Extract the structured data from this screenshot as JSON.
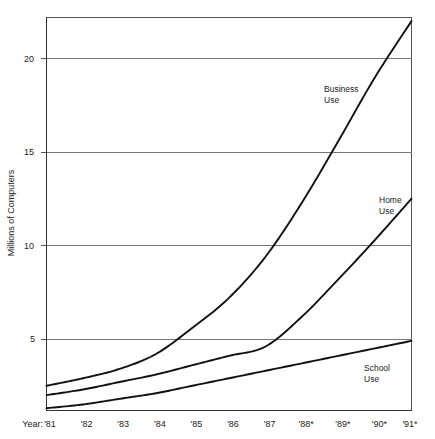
{
  "chart_data": {
    "type": "line",
    "title": "",
    "xlabel": "Year:",
    "ylabel": "Millions of Computers",
    "categories": [
      "'81",
      "'82",
      "'83",
      "'84",
      "'85",
      "'86",
      "'87",
      "'88*",
      "'89*",
      "'90*",
      "'91*"
    ],
    "ylim": [
      0,
      22.5
    ],
    "xlim_labels": [
      "'81",
      "'91*"
    ],
    "y_ticks": [
      5,
      10,
      15,
      20
    ],
    "y_tick_labels": [
      "5",
      "10",
      "15",
      "20"
    ],
    "grid": "horizontal",
    "legend_position": "inline-annotations",
    "series": [
      {
        "name": "Business Use",
        "label_line1": "Business",
        "label_line2": "Use",
        "values": [
          2.5,
          2.9,
          3.4,
          4.2,
          5.6,
          7.2,
          9.4,
          12.3,
          15.6,
          19.0,
          22.0
        ],
        "color": "#111111"
      },
      {
        "name": "Home Use",
        "label_line1": "Home",
        "label_line2": "Use",
        "values": [
          2.0,
          2.3,
          2.7,
          3.1,
          3.6,
          4.1,
          4.6,
          6.2,
          8.2,
          10.3,
          12.5
        ],
        "color": "#111111"
      },
      {
        "name": "School Use",
        "label_line1": "School",
        "label_line2": "Use",
        "values": [
          1.3,
          1.5,
          1.8,
          2.1,
          2.5,
          2.9,
          3.3,
          3.7,
          4.1,
          4.5,
          4.9
        ],
        "color": "#111111"
      }
    ],
    "annotations": [
      {
        "text": "Business Use",
        "x_year": "'87",
        "y_value": 18.4
      },
      {
        "text": "Home Use",
        "x_year": "'90*",
        "y_value": 12.6
      },
      {
        "text": "School Use",
        "x_year": "'90*",
        "y_value": 4.0
      }
    ]
  },
  "axis": {
    "y_title": "Millions of Computers",
    "x_prefix": "Year:",
    "y_tick_20": "20",
    "y_tick_15": "15",
    "y_tick_10": "10",
    "y_tick_5": "5"
  },
  "x_labels": {
    "y81": "'81",
    "y82": "'82",
    "y83": "'83",
    "y84": "'84",
    "y85": "'85",
    "y86": "'86",
    "y87": "'87",
    "y88": "'88*",
    "y89": "'89*",
    "y90": "'90*",
    "y91": "'91*"
  },
  "series_labels": {
    "business_1": "Business",
    "business_2": "Use",
    "home_1": "Home",
    "home_2": "Use",
    "school_1": "School",
    "school_2": "Use"
  }
}
